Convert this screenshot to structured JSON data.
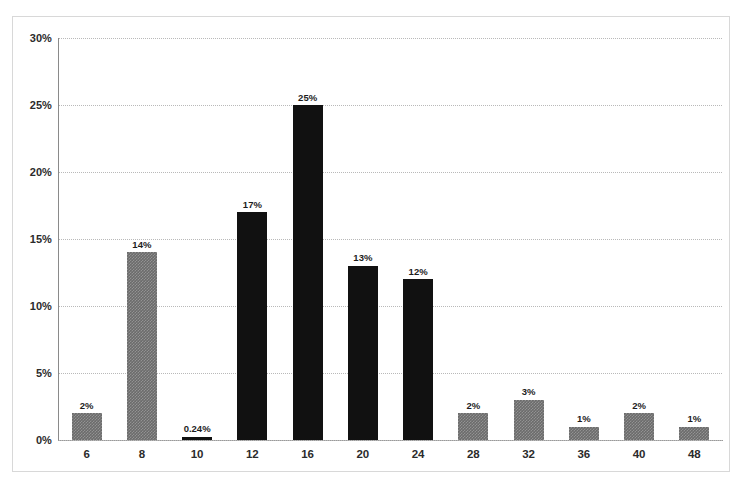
{
  "chart_data": {
    "type": "bar",
    "title": "",
    "subtitle": "",
    "xlabel": "",
    "ylabel": "",
    "categories": [
      "6",
      "8",
      "10",
      "12",
      "16",
      "20",
      "24",
      "28",
      "32",
      "36",
      "40",
      "48"
    ],
    "values": [
      2,
      14,
      0.24,
      17,
      25,
      13,
      12,
      2,
      3,
      1,
      2,
      1
    ],
    "value_labels": [
      "2%",
      "14%",
      "0.24%",
      "17%",
      "25%",
      "13%",
      "12%",
      "2%",
      "3%",
      "1%",
      "2%",
      "1%"
    ],
    "bar_colors": [
      "gray",
      "gray",
      "dark",
      "dark",
      "dark",
      "dark",
      "dark",
      "gray",
      "gray",
      "gray",
      "gray",
      "gray"
    ],
    "ylim": [
      0,
      30
    ],
    "ytick_values": [
      0,
      5,
      10,
      15,
      20,
      25,
      30
    ],
    "ytick_labels": [
      "0%",
      "5%",
      "10%",
      "15%",
      "20%",
      "25%",
      "30%"
    ],
    "grid": true,
    "grid_axis": "y",
    "grid_style": "dotted",
    "legend": null,
    "legend_position": "none",
    "annotations": "Each bar is labelled above with its percentage value.",
    "colors": {
      "dark_bar": "#111111",
      "gray_bar": "#6b6b6b",
      "gridline": "#b9b9b9",
      "axis": "#8a8a8a",
      "frame": "#d8d8d8",
      "text": "#2b2b2b",
      "background": "#ffffff"
    }
  }
}
